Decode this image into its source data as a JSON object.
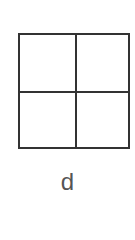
{
  "figure": {
    "label": "d",
    "grid": {
      "rows": 2,
      "cols": 2
    },
    "line_color": "#333333",
    "label_color": "#555555"
  }
}
